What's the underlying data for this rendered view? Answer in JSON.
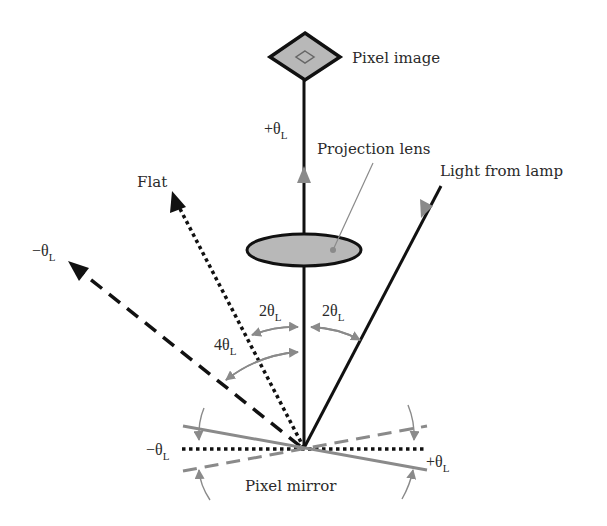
{
  "diagram": {
    "title": "",
    "labels": {
      "pixel_image": "Pixel image",
      "projection_lens": "Projection lens",
      "light_from_lamp": "Light from lamp",
      "flat": "Flat",
      "pixel_mirror": "Pixel mirror"
    },
    "angles": {
      "plus_theta_top": {
        "sign": "+",
        "sym": "θ",
        "sub": "L"
      },
      "minus_theta_left": {
        "sign": "−",
        "sym": "θ",
        "sub": "L"
      },
      "two_theta_left": {
        "coef": "2",
        "sym": "θ",
        "sub": "L"
      },
      "two_theta_right": {
        "coef": "2",
        "sym": "θ",
        "sub": "L"
      },
      "four_theta": {
        "coef": "4",
        "sym": "θ",
        "sub": "L"
      },
      "minus_theta_mirror": {
        "sign": "−",
        "sym": "θ",
        "sub": "L"
      },
      "plus_theta_mirror": {
        "sign": "+",
        "sym": "θ",
        "sub": "L"
      }
    },
    "colors": {
      "line": "#111111",
      "gray": "#8a8a8a",
      "fill": "#b8b8b8"
    },
    "rays": [
      {
        "name": "projection-axis",
        "style": "solid",
        "from": [
          304,
          448
        ],
        "to": [
          304,
          80
        ]
      },
      {
        "name": "light-from-lamp",
        "style": "solid",
        "from": [
          441,
          186
        ],
        "to": [
          304,
          448
        ]
      },
      {
        "name": "flat-ray",
        "style": "dotted",
        "from": [
          304,
          448
        ],
        "to": [
          172,
          192
        ]
      },
      {
        "name": "minus-theta-ray",
        "style": "dashed",
        "from": [
          304,
          448
        ],
        "to": [
          69,
          262
        ]
      }
    ]
  }
}
